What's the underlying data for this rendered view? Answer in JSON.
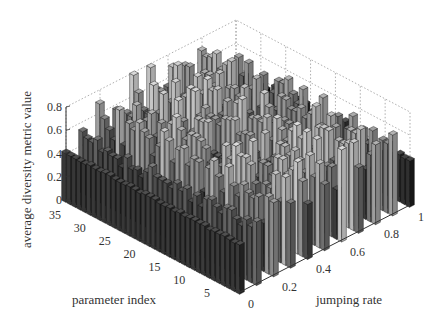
{
  "chart_data": {
    "type": "bar3d",
    "title": "",
    "xlabel": "jumping rate",
    "ylabel": "parameter index",
    "zlabel": "average diversity metric value",
    "x_ticks": [
      "0",
      "0.2",
      "0.4",
      "0.6",
      "0.8",
      "1"
    ],
    "x_values": [
      0,
      0.1,
      0.2,
      0.3,
      0.4,
      0.5,
      0.6,
      0.7,
      0.8,
      0.9,
      1.0
    ],
    "y_ticks": [
      "5",
      "10",
      "15",
      "20",
      "25",
      "30",
      "35"
    ],
    "y_range": [
      1,
      36
    ],
    "z_ticks": [
      "0",
      "0.2",
      "0.4",
      "0.6",
      "0.8"
    ],
    "zlim": [
      0,
      0.8
    ],
    "grid": true,
    "grid_style": "dotted",
    "color_scheme": "grayscale (dark = low, light = high)",
    "series_by_jumping_rate": [
      {
        "jumping_rate": 0.0,
        "approx_range": [
          0.4,
          0.44
        ],
        "typical": 0.42
      },
      {
        "jumping_rate": 0.1,
        "approx_range": [
          0.4,
          0.55
        ],
        "typical": 0.45
      },
      {
        "jumping_rate": 0.2,
        "approx_range": [
          0.4,
          0.75
        ],
        "typical": 0.55
      },
      {
        "jumping_rate": 0.3,
        "approx_range": [
          0.4,
          0.8
        ],
        "typical": 0.6
      },
      {
        "jumping_rate": 0.4,
        "approx_range": [
          0.4,
          0.8
        ],
        "typical": 0.62
      },
      {
        "jumping_rate": 0.5,
        "approx_range": [
          0.45,
          0.8
        ],
        "typical": 0.65
      },
      {
        "jumping_rate": 0.6,
        "approx_range": [
          0.4,
          0.8
        ],
        "typical": 0.62
      },
      {
        "jumping_rate": 0.7,
        "approx_range": [
          0.4,
          0.8
        ],
        "typical": 0.6
      },
      {
        "jumping_rate": 0.8,
        "approx_range": [
          0.4,
          0.75
        ],
        "typical": 0.55
      },
      {
        "jumping_rate": 0.9,
        "approx_range": [
          0.35,
          0.7
        ],
        "typical": 0.5
      },
      {
        "jumping_rate": 1.0,
        "approx_range": [
          0.3,
          0.45
        ],
        "typical": 0.4
      }
    ]
  },
  "labels": {
    "zlabel": "average diversity metric value",
    "ylabel": "parameter index",
    "xlabel": "jumping rate"
  }
}
